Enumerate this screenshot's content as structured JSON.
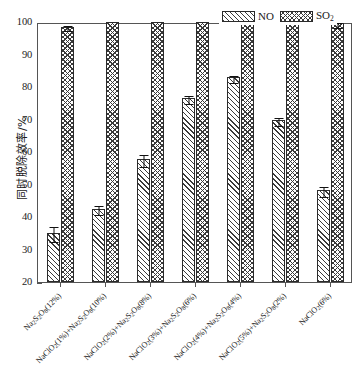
{
  "chart_data": {
    "type": "bar",
    "title": "",
    "xlabel": "",
    "ylabel": "同时脱除效率/%",
    "ylim": [
      20,
      100
    ],
    "ytick_labels": [
      "100",
      "90",
      "80",
      "70",
      "60",
      "50",
      "40",
      "30",
      "20"
    ],
    "yticks": [
      100,
      90,
      80,
      70,
      60,
      50,
      40,
      30,
      20
    ],
    "grid": false,
    "legend_position": "top-right",
    "categories": [
      "Na₂S₂O₈(12%)",
      "NaClO₂(1%)+Na₂S₂O₈(10%)",
      "NaClO₂(2%)+Na₂S₂O₈(8%)",
      "NaClO₂(3%)+Na₂S₂O₈(6%)",
      "NaClO₂(4%)+Na₂S₂O₈(4%)",
      "NaClO₂(5%)+Na₂S₂O₈(2%)",
      "NaClO₂(6%)"
    ],
    "series": [
      {
        "name": "NO",
        "pattern": "diagonal-hatch",
        "values": [
          35.2,
          42.6,
          57.8,
          76.6,
          83.0,
          69.8,
          48.2
        ],
        "errors": [
          2.2,
          1.4,
          1.8,
          1.2,
          1.0,
          1.2,
          1.5
        ]
      },
      {
        "name": "SO₂",
        "pattern": "cross-hatch",
        "values": [
          98.6,
          100.0,
          100.0,
          100.0,
          100.0,
          100.0,
          99.6
        ],
        "errors": [
          0.9,
          0.0,
          0.0,
          0.0,
          0.0,
          0.0,
          0.7
        ]
      }
    ]
  },
  "legend": {
    "items": [
      {
        "label_main": "NO",
        "label_sub": ""
      },
      {
        "label_main": "SO",
        "label_sub": "2"
      }
    ]
  },
  "axis": {
    "y_title": "同时脱除效率/%"
  }
}
